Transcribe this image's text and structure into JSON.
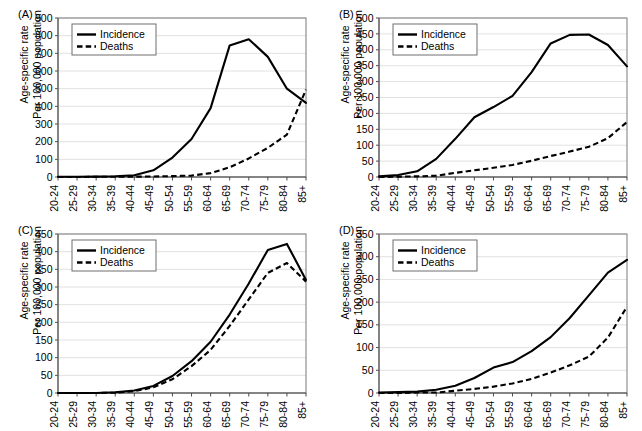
{
  "figure": {
    "panels": [
      "A",
      "B",
      "C",
      "D"
    ],
    "axis_label_line1": "Age-specific rate",
    "axis_label_line2": "Per 100,000 population",
    "legend": {
      "incidence": "Incidence",
      "deaths": "Deaths"
    }
  },
  "chart_data": [
    {
      "panel": "A",
      "label": "(A)",
      "type": "line",
      "title": "",
      "xlabel": "",
      "ylabel": "Age-specific rate Per 100,000 population",
      "grid": true,
      "legend_position": "top-left",
      "ylim": [
        0,
        900
      ],
      "yticks": [
        0,
        100,
        200,
        300,
        400,
        500,
        600,
        700,
        800,
        900
      ],
      "categories": [
        "20-24",
        "25-29",
        "30-34",
        "35-39",
        "40-44",
        "45-49",
        "50-54",
        "55-59",
        "60-64",
        "65-69",
        "70-74",
        "75-79",
        "80-84",
        "85+"
      ],
      "series": [
        {
          "name": "Incidence",
          "style": "solid",
          "values": [
            1,
            1,
            2,
            4,
            10,
            38,
            110,
            215,
            390,
            745,
            780,
            680,
            500,
            420
          ]
        },
        {
          "name": "Deaths",
          "style": "dashed",
          "values": [
            0,
            0,
            1,
            1,
            2,
            3,
            5,
            8,
            22,
            55,
            105,
            165,
            240,
            495
          ]
        }
      ]
    },
    {
      "panel": "B",
      "label": "(B)",
      "type": "line",
      "title": "",
      "xlabel": "",
      "ylabel": "Age-specific rate Per 100,000 population",
      "grid": true,
      "legend_position": "top-left",
      "ylim": [
        0,
        500
      ],
      "yticks": [
        0,
        50,
        100,
        150,
        200,
        250,
        300,
        350,
        400,
        450,
        500
      ],
      "categories": [
        "20-24",
        "25-29",
        "30-34",
        "35-39",
        "40-44",
        "45-49",
        "50-54",
        "55-59",
        "60-64",
        "65-69",
        "70-74",
        "75-79",
        "80-84",
        "85+"
      ],
      "series": [
        {
          "name": "Incidence",
          "style": "solid",
          "values": [
            2,
            6,
            18,
            57,
            120,
            188,
            220,
            255,
            330,
            420,
            447,
            448,
            415,
            348
          ]
        },
        {
          "name": "Deaths",
          "style": "dashed",
          "values": [
            0,
            1,
            2,
            4,
            13,
            21,
            29,
            38,
            51,
            66,
            80,
            95,
            122,
            173
          ]
        }
      ]
    },
    {
      "panel": "C",
      "label": "(C)",
      "type": "line",
      "title": "",
      "xlabel": "",
      "ylabel": "Age-specific rate Per 100,000 population",
      "grid": true,
      "legend_position": "top-left",
      "ylim": [
        0,
        450
      ],
      "yticks": [
        0,
        50,
        100,
        150,
        200,
        250,
        300,
        350,
        400,
        450
      ],
      "categories": [
        "20-24",
        "25-29",
        "30-34",
        "35-39",
        "40-44",
        "45-49",
        "50-54",
        "55-59",
        "60-64",
        "65-69",
        "70-74",
        "75-79",
        "80-84",
        "85+"
      ],
      "series": [
        {
          "name": "Incidence",
          "style": "solid",
          "values": [
            0,
            0,
            0,
            2,
            7,
            20,
            48,
            90,
            145,
            222,
            310,
            405,
            422,
            320
          ]
        },
        {
          "name": "Deaths",
          "style": "dashed",
          "values": [
            0,
            0,
            0,
            1,
            5,
            16,
            39,
            76,
            122,
            190,
            265,
            340,
            368,
            315
          ]
        }
      ]
    },
    {
      "panel": "D",
      "label": "(D)",
      "type": "line",
      "title": "",
      "xlabel": "",
      "ylabel": "Age-specific rate Per 100,000 population",
      "grid": true,
      "legend_position": "top-left",
      "ylim": [
        0,
        350
      ],
      "yticks": [
        0,
        50,
        100,
        150,
        200,
        250,
        300,
        350
      ],
      "categories": [
        "20-24",
        "25-29",
        "30-34",
        "35-39",
        "40-44",
        "45-49",
        "50-54",
        "55-59",
        "60-64",
        "65-69",
        "70-74",
        "75-79",
        "80-84",
        "85+"
      ],
      "series": [
        {
          "name": "Incidence",
          "style": "solid",
          "values": [
            1,
            2,
            3,
            7,
            16,
            33,
            56,
            68,
            92,
            123,
            165,
            215,
            265,
            293
          ]
        },
        {
          "name": "Deaths",
          "style": "dashed",
          "values": [
            0,
            0,
            1,
            1,
            5,
            9,
            14,
            21,
            31,
            45,
            61,
            80,
            122,
            190
          ]
        }
      ]
    }
  ]
}
